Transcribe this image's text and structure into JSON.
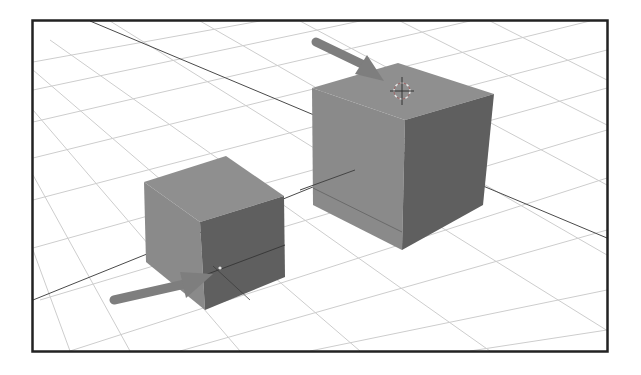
{
  "scene": {
    "description": "3D viewport with grid floor, two gray cubes, two arrows and 3D cursor",
    "colors": {
      "background": "#ffffff",
      "frame": "#222222",
      "grid": "#c8c8c8",
      "axis_line": "#4a4a4a",
      "cube_front": "#8a8a8a",
      "cube_top": "#8e8e8e",
      "cube_right": "#5e5e5e",
      "arrow": "#7e7e7e",
      "cursor": "#e6e6e6"
    },
    "objects": [
      {
        "name": "large-cube",
        "position": "right"
      },
      {
        "name": "small-cube",
        "position": "left"
      }
    ],
    "arrows": [
      {
        "name": "arrow-to-3d-cursor",
        "points_to": "top of large cube"
      },
      {
        "name": "arrow-to-origin",
        "points_to": "small cube origin"
      }
    ]
  }
}
